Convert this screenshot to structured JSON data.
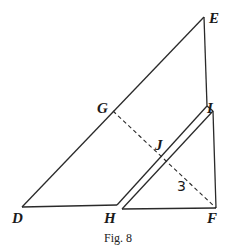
{
  "figure": {
    "caption": "Fig. 8",
    "angle_label": "3",
    "points": {
      "D": {
        "label": "D",
        "x": 22,
        "y": 207
      },
      "E": {
        "label": "E",
        "x": 204,
        "y": 17
      },
      "G": {
        "label": "G",
        "x": 113,
        "y": 111
      },
      "H": {
        "label": "H",
        "x": 117,
        "y": 205
      },
      "I": {
        "label": "I",
        "x": 207,
        "y": 106
      },
      "J": {
        "label": "J",
        "x": 160,
        "y": 158
      },
      "F": {
        "label": "F",
        "x": 216,
        "y": 208
      }
    },
    "segments": [
      "DE",
      "EI",
      "DH",
      "HI (double line)",
      "HF",
      "IF",
      "GF (dashed)"
    ],
    "colors": {
      "stroke": "#2a2a2a",
      "background": "#ffffff"
    }
  }
}
